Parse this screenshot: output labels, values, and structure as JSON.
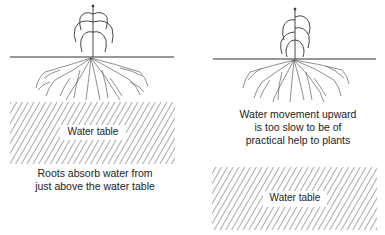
{
  "panels": [
    {
      "id": "left",
      "water_table_label": "Water table",
      "caption_lines": [
        "Roots absorb water from",
        "just above the water table"
      ]
    },
    {
      "id": "right",
      "water_table_label": "Water table",
      "caption_lines": [
        "Water movement upward",
        "is too slow to be of",
        "practical help to plants"
      ]
    }
  ],
  "colors": {
    "line": "#333333",
    "hatch": "#555555",
    "background": "#ffffff"
  }
}
